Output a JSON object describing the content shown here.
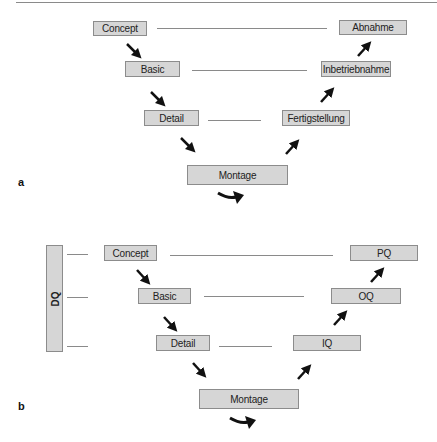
{
  "panel_a": {
    "label": "a",
    "left_boxes": [
      {
        "text": "Concept"
      },
      {
        "text": "Basic"
      },
      {
        "text": "Detail"
      }
    ],
    "right_boxes": [
      {
        "text": "Abnahme"
      },
      {
        "text": "Inbetriebnahme"
      },
      {
        "text": "Fertigstellung"
      }
    ],
    "bottom_box": {
      "text": "Montage"
    }
  },
  "panel_b": {
    "label": "b",
    "side_bar": {
      "text": "DQ"
    },
    "left_boxes": [
      {
        "text": "Concept"
      },
      {
        "text": "Basic"
      },
      {
        "text": "Detail"
      }
    ],
    "right_boxes": [
      {
        "text": "PQ"
      },
      {
        "text": "OQ"
      },
      {
        "text": "IQ"
      }
    ],
    "bottom_box": {
      "text": "Montage"
    }
  },
  "colors": {
    "box_fill": "#d6d6d6",
    "box_border": "#8c8c8c",
    "line": "#8a8a8a",
    "arrow": "#111111"
  }
}
